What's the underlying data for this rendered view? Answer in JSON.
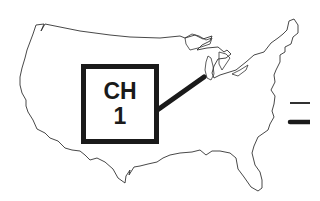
{
  "map": {
    "subject": "contiguous United States outline",
    "outline_color": "#333333",
    "background_color": "#ffffff"
  },
  "callout": {
    "line1": "CH",
    "line2": "1",
    "border_color": "#1a1a1a",
    "pointer_target": "Lake Michigan / Chicago area"
  },
  "legend": {
    "items": [
      {
        "style": "thin-line",
        "color": "#1a1a1a"
      },
      {
        "style": "thick-line",
        "color": "#1a1a1a"
      }
    ]
  }
}
